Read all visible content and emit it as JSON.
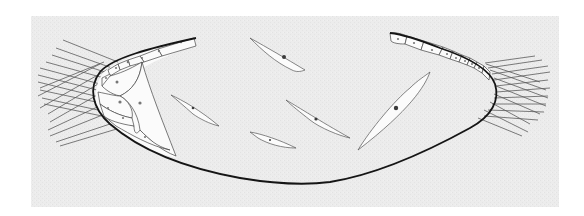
{
  "figure": {
    "type": "histology-illustration",
    "colors": {
      "background": "#ffffff",
      "panel": "#ececec",
      "outline": "#1a1a1a",
      "fibre": "#555555",
      "cell_fill": "#fbfbfb",
      "cell_line": "#444444"
    },
    "labels": []
  }
}
